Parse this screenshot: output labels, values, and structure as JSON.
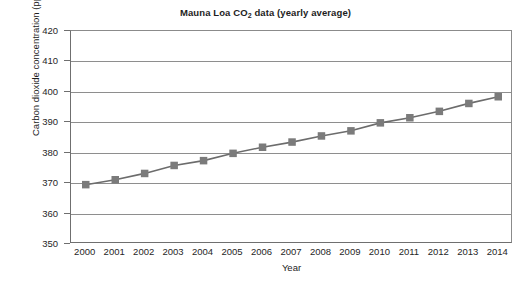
{
  "chart_data": {
    "type": "line",
    "title": "Mauna Loa CO2 data (yearly average)",
    "title_parts": {
      "before_sub": "Mauna Loa CO",
      "sub": "2",
      "after_sub": " data (yearly average)"
    },
    "xlabel": "Year",
    "ylabel": "Carbon dioxide concentration (ppm)",
    "x": [
      2000,
      2001,
      2002,
      2003,
      2004,
      2005,
      2006,
      2007,
      2008,
      2009,
      2010,
      2011,
      2012,
      2013,
      2014
    ],
    "xtick_labels": [
      "2000",
      "2001",
      "2002",
      "2003",
      "2004",
      "2005",
      "2006",
      "2007",
      "2008",
      "2009",
      "2010",
      "2011",
      "2012",
      "2013",
      "2014"
    ],
    "values": [
      369.5,
      371.1,
      373.2,
      375.8,
      377.4,
      379.8,
      381.8,
      383.5,
      385.5,
      387.2,
      389.8,
      391.5,
      393.6,
      396.2,
      398.4
    ],
    "ylim": [
      350,
      420
    ],
    "ytick_labels": [
      "420",
      "410",
      "400",
      "390",
      "380",
      "370",
      "360",
      "350"
    ],
    "yticks": [
      420,
      410,
      400,
      390,
      380,
      370,
      360,
      350
    ],
    "ystep": 10,
    "xlim": [
      1999.5,
      2014.5
    ],
    "grid": "horizontal",
    "legend": "none",
    "marker": "square",
    "colors": {
      "marker": "#7b7b7b",
      "line": "#6c6c6c",
      "gridline": "#8e8e8e",
      "axis": "#6f6f6f",
      "text": "#1d1d1d",
      "background": "#ffffff"
    }
  }
}
